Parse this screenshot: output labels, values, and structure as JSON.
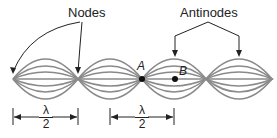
{
  "labels": {
    "nodes": "Nodes",
    "antinodes": "Antinodes",
    "point_a": "A",
    "point_b": "B"
  },
  "dimensions": [
    {
      "numerator": "λ",
      "denominator": "2"
    },
    {
      "numerator": "λ",
      "denominator": "2"
    }
  ],
  "colors": {
    "wave": "#888888",
    "text": "#222222"
  }
}
